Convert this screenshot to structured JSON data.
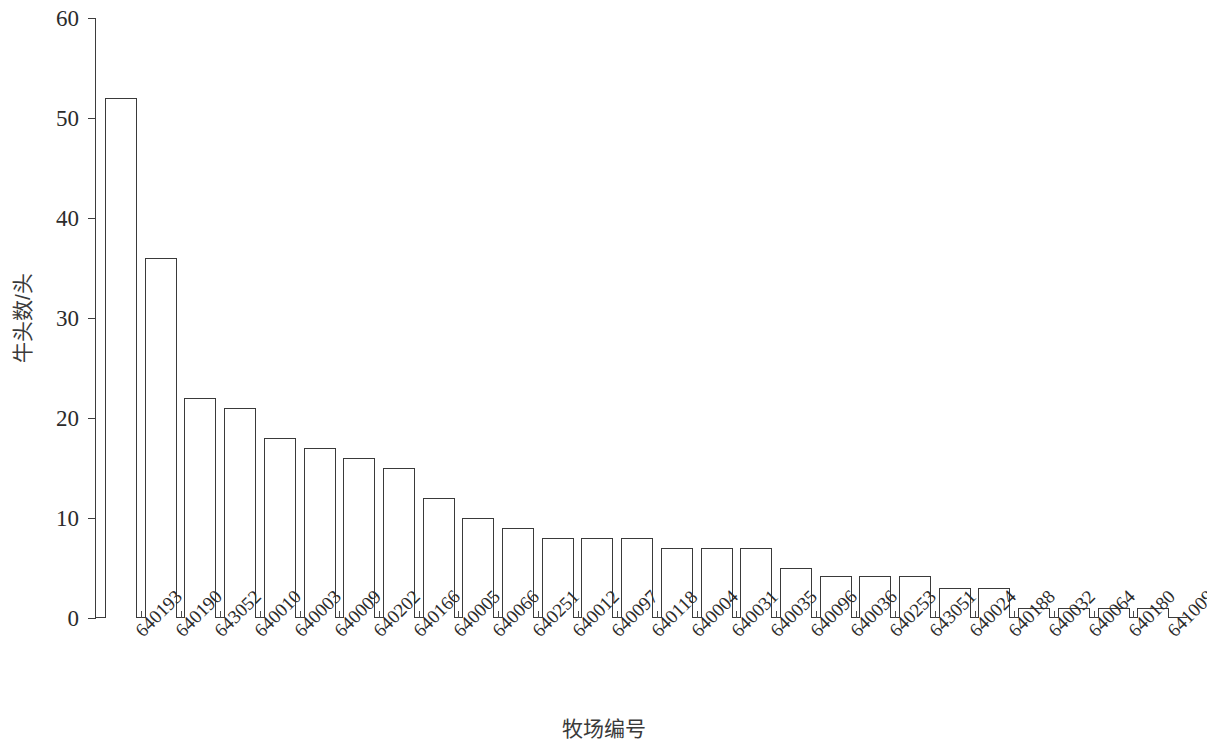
{
  "chart_data": {
    "type": "bar",
    "title": "",
    "subtitle": "",
    "xlabel": "牧场编号",
    "ylabel": "牛头数/头",
    "categories": [
      "640193",
      "640190",
      "643052",
      "640010",
      "640003",
      "640009",
      "640202",
      "640166",
      "640005",
      "640066",
      "640251",
      "640012",
      "640097",
      "640118",
      "640004",
      "640031",
      "640035",
      "640096",
      "640036",
      "640253",
      "643051",
      "640024",
      "640188",
      "640032",
      "640064",
      "640180",
      "641009"
    ],
    "values": [
      52,
      36,
      22,
      21,
      18,
      17,
      16,
      15,
      12,
      10,
      9,
      8,
      8,
      8,
      7,
      7,
      7,
      5,
      4.2,
      4.2,
      4.2,
      3,
      3,
      1,
      1,
      1,
      1
    ],
    "ylim": [
      0,
      60
    ],
    "yticks": [
      0,
      10,
      20,
      30,
      40,
      50,
      60
    ],
    "ytick_labels": [
      "0",
      "10",
      "20",
      "30",
      "40",
      "50",
      "60"
    ],
    "grid": false,
    "legend": null,
    "bar_style": {
      "fill": "#ffffff",
      "edge": "#3a3a3a",
      "edge_width": 1
    },
    "axis_color": "#3d3d3d",
    "background": "#ffffff"
  }
}
